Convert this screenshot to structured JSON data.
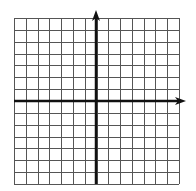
{
  "diagram": {
    "type": "coordinate-grid",
    "grid": {
      "columns": 14,
      "rows": 14,
      "left": 14,
      "top": 18,
      "right": 179,
      "bottom": 184,
      "line_color": "#555555",
      "line_width": 1
    },
    "axes": {
      "color": "#111111",
      "line_width": 2.5,
      "x_axis": {
        "y": 101,
        "x_start": 14,
        "x_end": 186,
        "arrow": "right"
      },
      "y_axis": {
        "x": 96,
        "y_start": 184,
        "y_end": 10,
        "arrow": "up"
      }
    },
    "labels": []
  }
}
